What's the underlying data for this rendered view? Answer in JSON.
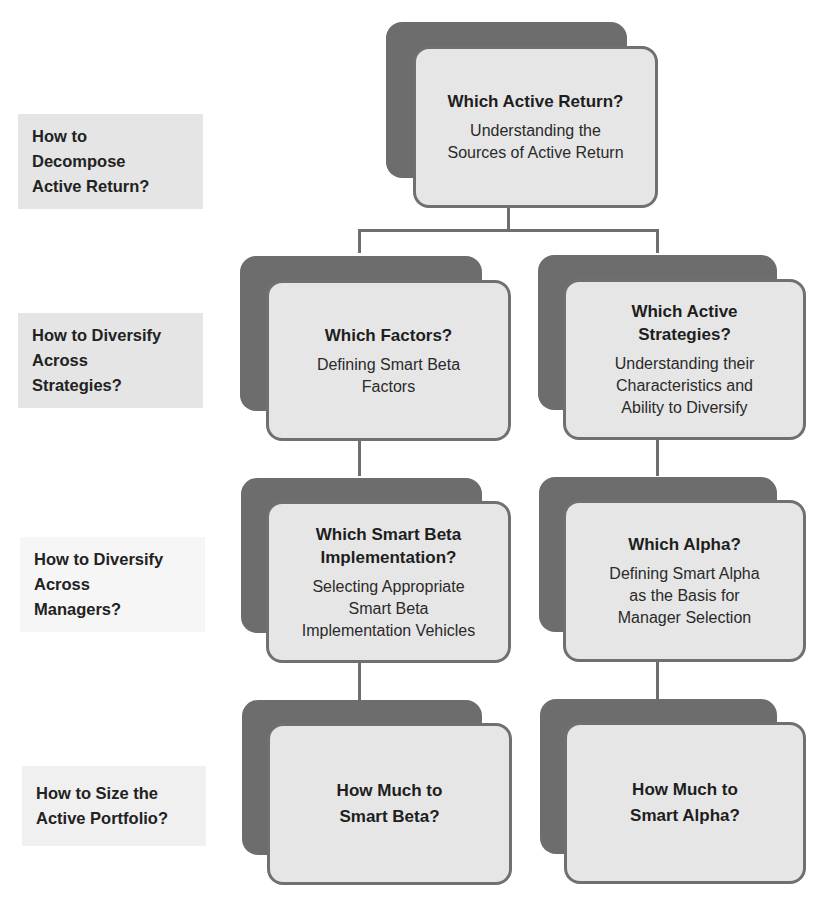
{
  "colors": {
    "back_card": "#6d6d6d",
    "front_card_fill": "#e6e6e6",
    "front_card_border": "#707070",
    "connector": "#6e6e6e",
    "label_box_fill": "#e5e5e5",
    "label_box_faint_fill": "#f6f6f6"
  },
  "row_labels": [
    {
      "lines": [
        "How to",
        "Decompose",
        "Active Return?"
      ]
    },
    {
      "lines": [
        "How to Diversify",
        "Across",
        "Strategies?"
      ]
    },
    {
      "lines": [
        "How to Diversify",
        "Across",
        "Managers?"
      ]
    },
    {
      "lines": [
        "How to Size the",
        "Active Portfolio?"
      ]
    }
  ],
  "nodes": {
    "root": {
      "title": [
        "Which Active Return?"
      ],
      "subtitle": [
        "Understanding the",
        "Sources of Active Return"
      ]
    },
    "factors": {
      "title": [
        "Which Factors?"
      ],
      "subtitle": [
        "Defining Smart Beta",
        "Factors"
      ]
    },
    "active_strategies": {
      "title": [
        "Which Active",
        "Strategies?"
      ],
      "subtitle": [
        "Understanding their",
        "Characteristics and",
        "Ability to Diversify"
      ]
    },
    "smart_beta_impl": {
      "title": [
        "Which Smart Beta",
        "Implementation?"
      ],
      "subtitle": [
        "Selecting Appropriate",
        "Smart Beta",
        "Implementation Vehicles"
      ]
    },
    "alpha": {
      "title": [
        "Which Alpha?"
      ],
      "subtitle": [
        "Defining Smart Alpha",
        "as the Basis for",
        "Manager Selection"
      ]
    },
    "size_beta": {
      "title": [
        "How Much to",
        "Smart Beta?"
      ],
      "subtitle": []
    },
    "size_alpha": {
      "title": [
        "How Much to",
        "Smart Alpha?"
      ],
      "subtitle": []
    }
  }
}
